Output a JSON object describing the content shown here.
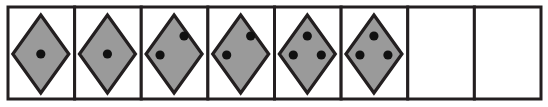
{
  "colors": {
    "stroke": "#231f20",
    "diamond_fill": "#9a9a9a",
    "dot": "#111111",
    "cell_bg": "#ffffff"
  },
  "cells": [
    {
      "index": 1,
      "has_diamond": true,
      "dots": [
        "center"
      ]
    },
    {
      "index": 2,
      "has_diamond": true,
      "dots": [
        "center"
      ]
    },
    {
      "index": 3,
      "has_diamond": true,
      "dots": [
        "top-right",
        "left"
      ]
    },
    {
      "index": 4,
      "has_diamond": true,
      "dots": [
        "top-right",
        "left"
      ]
    },
    {
      "index": 5,
      "has_diamond": true,
      "dots": [
        "top",
        "left",
        "right"
      ]
    },
    {
      "index": 6,
      "has_diamond": true,
      "dots": [
        "top",
        "left",
        "right"
      ]
    },
    {
      "index": 7,
      "has_diamond": false,
      "dots": []
    },
    {
      "index": 8,
      "has_diamond": false,
      "dots": []
    }
  ]
}
